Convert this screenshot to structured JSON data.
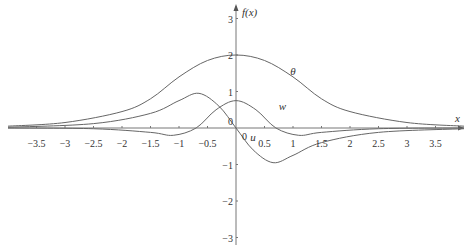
{
  "chart_data": {
    "type": "line",
    "title": "",
    "xlabel": "x",
    "ylabel": "f(x)",
    "xlim": [
      -4,
      4
    ],
    "ylim": [
      -3.5,
      3.5
    ],
    "grid": false,
    "x_ticks": [
      "-3.5",
      "-3",
      "-2.5",
      "-2",
      "-1.5",
      "-1",
      "-0.5",
      "0.5",
      "1",
      "1.5",
      "2",
      "2.5",
      "3",
      "3.5"
    ],
    "y_ticks": [
      "3",
      "2",
      "1",
      "0",
      "-1",
      "-2",
      "-3"
    ],
    "origin_label": "0",
    "series": [
      {
        "name": "θ",
        "x": [
          -4,
          -3,
          -2,
          -1.5,
          -1,
          -0.5,
          0,
          0.5,
          1,
          1.5,
          2,
          3,
          4
        ],
        "values": [
          0.05,
          0.15,
          0.45,
          0.8,
          1.4,
          1.85,
          2.0,
          1.85,
          1.4,
          0.8,
          0.45,
          0.15,
          0.05
        ]
      },
      {
        "name": "w",
        "x": [
          -4,
          -2.5,
          -1.5,
          -1.1,
          -0.7,
          -0.35,
          0,
          0.35,
          0.7,
          1.1,
          1.5,
          2.5,
          4
        ],
        "values": [
          0,
          -0.02,
          -0.12,
          -0.2,
          0,
          0.5,
          0.75,
          0.5,
          0,
          -0.2,
          -0.12,
          -0.02,
          0
        ]
      },
      {
        "name": "u",
        "x": [
          -4,
          -2.5,
          -1.5,
          -1,
          -0.65,
          -0.3,
          0,
          0.3,
          0.65,
          1,
          1.5,
          2.5,
          4
        ],
        "values": [
          0.02,
          0.12,
          0.4,
          0.75,
          0.95,
          0.6,
          0,
          -0.6,
          -0.95,
          -0.75,
          -0.4,
          -0.12,
          -0.02
        ]
      }
    ],
    "annotations": [
      {
        "text": "θ",
        "x": 0.95,
        "y": 1.45
      },
      {
        "text": "w",
        "x": 0.75,
        "y": 0.5
      },
      {
        "text": "u",
        "x": 0.25,
        "y": -0.35
      }
    ]
  }
}
